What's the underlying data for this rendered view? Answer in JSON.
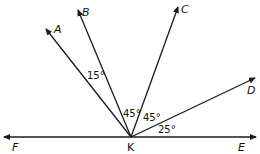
{
  "diagram": {
    "vertex": {
      "label": "K"
    },
    "points": {
      "A": "A",
      "B": "B",
      "C": "C",
      "D": "D",
      "E": "E",
      "F": "F"
    },
    "angles": {
      "AKB": "15°",
      "BKC": "45°",
      "CKD": "45°",
      "DKE": "25°"
    },
    "stroke_color": "#1a1a1a"
  }
}
